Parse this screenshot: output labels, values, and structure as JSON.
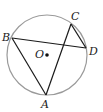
{
  "diagram": {
    "type": "circle-geometry",
    "circle": {
      "center_label": "O",
      "cx": 47,
      "cy": 55,
      "r": 40,
      "stroke": "#9a9a9a"
    },
    "points": [
      {
        "label": "A",
        "x": 46,
        "y": 95,
        "lx": 41,
        "ly": 108
      },
      {
        "label": "B",
        "x": 12,
        "y": 38,
        "lx": 2,
        "ly": 41
      },
      {
        "label": "C",
        "x": 71,
        "y": 24,
        "lx": 71,
        "ly": 20
      },
      {
        "label": "D",
        "x": 86,
        "y": 48,
        "lx": 89,
        "ly": 55
      },
      {
        "label": "O",
        "x": 47,
        "y": 55,
        "lx": 35,
        "ly": 58
      }
    ],
    "segments": [
      {
        "from": "B",
        "to": "D"
      },
      {
        "from": "B",
        "to": "A"
      },
      {
        "from": "A",
        "to": "C"
      },
      {
        "from": "C",
        "to": "D"
      }
    ],
    "line_color": "#1a1a1a"
  }
}
